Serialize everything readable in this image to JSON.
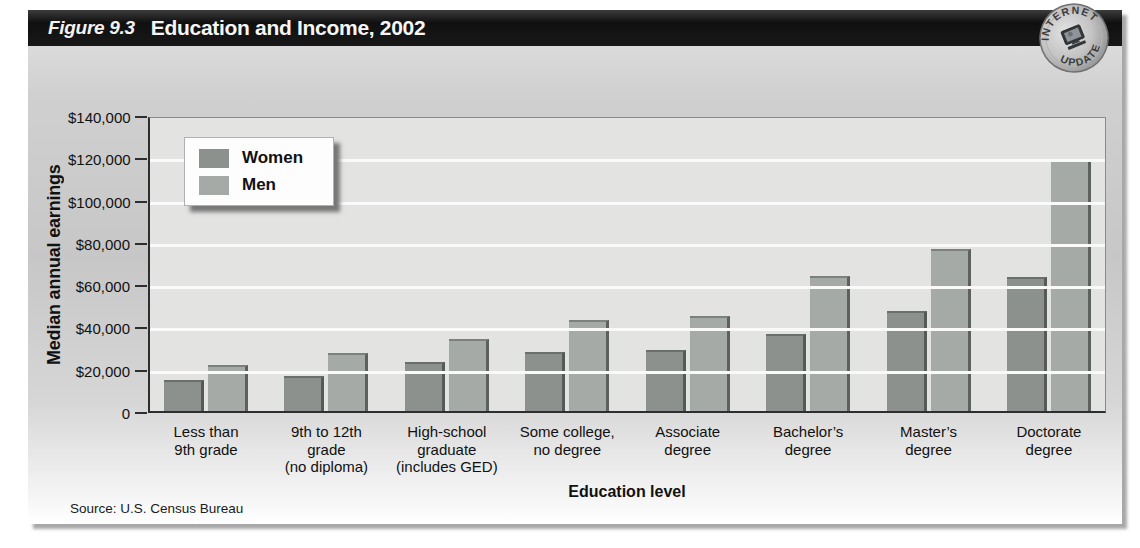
{
  "figure": {
    "title_prefix": "Figure 9.3",
    "title": "Education and Income, 2002",
    "badge": {
      "top_text": "INTERNET",
      "bottom_text": "UPDATE",
      "icon": "computer-icon"
    },
    "source": "Source: U.S. Census Bureau"
  },
  "chart_data": {
    "type": "bar",
    "title": "Education and Income, 2002",
    "xlabel": "Education level",
    "ylabel": "Median annual earnings",
    "ylim": [
      0,
      140000
    ],
    "y_tick_step": 20000,
    "y_tick_labels": [
      "$140,000",
      "$120,000",
      "$100,000",
      "$80,000",
      "$60,000",
      "$40,000",
      "$20,000",
      "0"
    ],
    "grid": "horizontal-white-lines",
    "legend_position": "upper-left",
    "categories": [
      "Less than\n9th grade",
      "9th to 12th\ngrade\n(no diploma)",
      "High-school\ngraduate\n(includes GED)",
      "Some college,\nno degree",
      "Associate\ndegree",
      "Bachelor’s\ndegree",
      "Master’s\ndegree",
      "Doctorate\ndegree"
    ],
    "series": [
      {
        "name": "Women",
        "color": "#8d918e",
        "values": [
          14500,
          16500,
          23000,
          28000,
          29000,
          36500,
          47500,
          63500
        ]
      },
      {
        "name": "Men",
        "color": "#a6aaa6",
        "values": [
          21700,
          27500,
          34000,
          43000,
          45000,
          64000,
          76500,
          119000
        ]
      }
    ]
  }
}
